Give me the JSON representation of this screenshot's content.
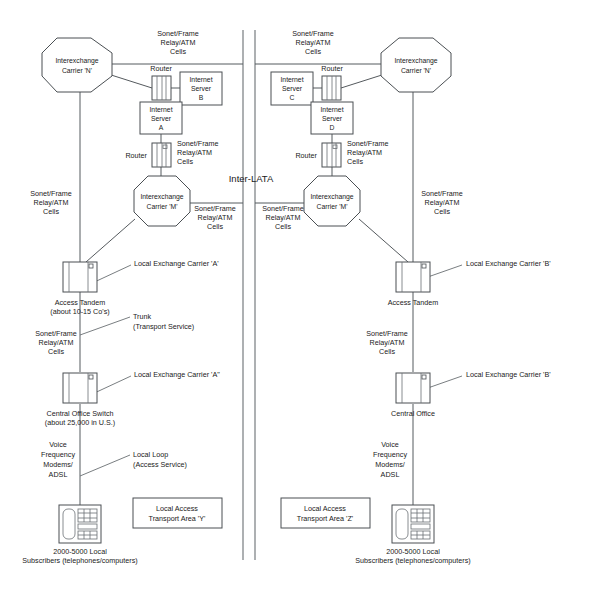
{
  "diagram": {
    "center_label": "Inter-LATA",
    "colors": {
      "line": "#555a5e",
      "shape_stroke": "#4a4f53",
      "text": "#1a1a1a",
      "background": "#ffffff"
    }
  },
  "nodes": {
    "iec_n_left": {
      "label_line1": "Interexchange",
      "label_line2": "Carrier 'N'"
    },
    "iec_n_right": {
      "label_line1": "Interexchange",
      "label_line2": "Carrier 'N'"
    },
    "iec_m_left": {
      "label_line1": "Interexchange",
      "label_line2": "Carrier 'M'"
    },
    "iec_m_right": {
      "label_line1": "Interexchange",
      "label_line2": "Carrier 'M'"
    },
    "server_a": {
      "line1": "Internet",
      "line2": "Server",
      "line3": "A"
    },
    "server_b": {
      "line1": "Internet",
      "line2": "Server",
      "line3": "B"
    },
    "server_c": {
      "line1": "Internet",
      "line2": "Server",
      "line3": "C"
    },
    "server_d": {
      "line1": "Internet",
      "line2": "Server",
      "line3": "D"
    },
    "router_top_left": {
      "label": "Router"
    },
    "router_top_right": {
      "label": "Router"
    },
    "router_mid_left": {
      "label": "Router"
    },
    "router_mid_right": {
      "label": "Router"
    },
    "access_tandem_left": {
      "line1": "Access Tandem",
      "line2": "(about 10-15 Co's)"
    },
    "access_tandem_right": {
      "line1": "Access Tandem",
      "line2": ""
    },
    "central_office_left": {
      "line1": "Central Office Switch",
      "line2": "(about 25,000 in U.S.)"
    },
    "central_office_right": {
      "line1": "Central Office",
      "line2": ""
    },
    "phone_left": {
      "line1": "2000-5000 Local",
      "line2": "Subscribers (telephones/computers)"
    },
    "phone_right": {
      "line1": "2000-5000 Local",
      "line2": "Subscribers (telephones/computers)"
    },
    "lata_box_left": {
      "line1": "Local Access",
      "line2": "Transport Area 'Y'"
    },
    "lata_box_right": {
      "line1": "Local Access",
      "line2": "Transport Area 'Z'"
    }
  },
  "link_labels": {
    "sonet_top_left": {
      "l1": "Sonet/Frame",
      "l2": "Relay/ATM",
      "l3": "Cells"
    },
    "sonet_top_right": {
      "l1": "Sonet/Frame",
      "l2": "Relay/ATM",
      "l3": "Cells"
    },
    "sonet_router_left": {
      "l1": "Sonet/Frame",
      "l2": "Relay/ATM",
      "l3": "Cells"
    },
    "sonet_router_right": {
      "l1": "Sonet/Frame",
      "l2": "Relay/ATM",
      "l3": "Cells"
    },
    "sonet_farleft": {
      "l1": "Sonet/Frame",
      "l2": "Relay/ATM",
      "l3": "Cells"
    },
    "sonet_farright": {
      "l1": "Sonet/Frame",
      "l2": "Relay/ATM",
      "l3": "Cells"
    },
    "sonet_mid_left": {
      "l1": "Sonet/Frame",
      "l2": "Relay/ATM",
      "l3": "Cells"
    },
    "sonet_mid_right": {
      "l1": "Sonet/Frame",
      "l2": "Relay/ATM",
      "l3": "Cells"
    },
    "sonet_trunk_left": {
      "l1": "Sonet/Frame",
      "l2": "Relay/ATM",
      "l3": "Cells"
    },
    "sonet_trunk_right": {
      "l1": "Sonet/Frame",
      "l2": "Relay/ATM",
      "l3": "Cells"
    },
    "voice_left": {
      "l1": "Voice",
      "l2": "Frequency",
      "l3": "Modems/",
      "l4": "ADSL"
    },
    "voice_right": {
      "l1": "Voice",
      "l2": "Frequency",
      "l3": "Modems/",
      "l4": "ADSL"
    }
  },
  "callouts": {
    "lec_a_tandem": "Local Exchange Carrier 'A'",
    "lec_a_co": "Local Exchange Carrier 'A\"",
    "lec_b_tandem": "Local Exchange Carrier 'B'",
    "lec_b_co": "Local Exchange Carrier 'B'",
    "trunk": {
      "l1": "Trunk",
      "l2": "(Transport Service)"
    },
    "local_loop": {
      "l1": "Local Loop",
      "l2": "(Access Service)"
    }
  }
}
